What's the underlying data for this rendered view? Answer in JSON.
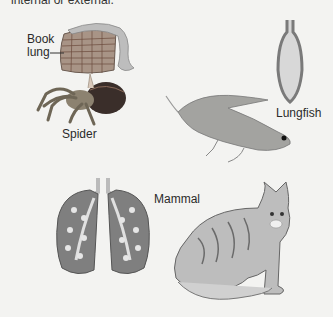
{
  "figure": {
    "caption_fragment": "internal or external.",
    "labels": {
      "book_lung": [
        "Book",
        "lung"
      ],
      "spider": "Spider",
      "lungfish": "Lungfish",
      "mammal": "Mammal"
    },
    "colors": {
      "background": "#f3f3f1",
      "organ_fill": "#8a8a8a",
      "organ_outline": "#555555",
      "lung_interior": "#d9d9d9",
      "text": "#2a2a2a"
    }
  }
}
